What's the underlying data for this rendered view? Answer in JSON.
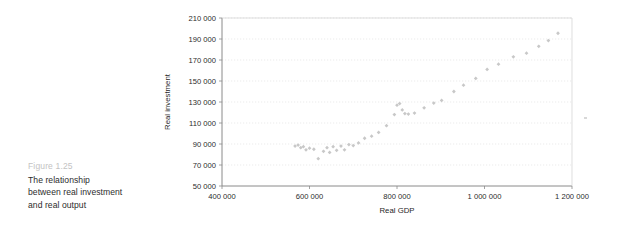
{
  "caption": {
    "figure_number": "Figure 1.25",
    "line1": "The relationship",
    "line2": "between real investment",
    "line3": "and real output"
  },
  "colors": {
    "marker": "#c8c8c8",
    "gridline": "#e2e2e2",
    "axis": "#8a8a8a",
    "figure_number": "#c3c3c3",
    "caption_text": "#2c2c2c",
    "background": "#ffffff"
  },
  "chart_data": {
    "type": "scatter",
    "title": "",
    "xlabel": "Real GDP",
    "ylabel": "Real investment",
    "xlim": [
      400000,
      1200000
    ],
    "ylim": [
      50000,
      210000
    ],
    "xticks": [
      400000,
      600000,
      800000,
      1000000,
      1200000
    ],
    "yticks": [
      50000,
      70000,
      90000,
      110000,
      130000,
      150000,
      170000,
      190000,
      210000
    ],
    "xtick_labels": [
      "400 000",
      "600 000",
      "800 000",
      "1 000 000",
      "1 200 000"
    ],
    "ytick_labels": [
      "50 000",
      "70 000",
      "90 000",
      "110 000",
      "130 000",
      "150 000",
      "170 000",
      "190 000",
      "210 000"
    ],
    "grid": "horizontal-dotted",
    "legend": "none",
    "marker_shape": "diamond",
    "points": [
      {
        "x": 567000,
        "y": 88000
      },
      {
        "x": 574000,
        "y": 89000
      },
      {
        "x": 580000,
        "y": 86500
      },
      {
        "x": 586000,
        "y": 87500
      },
      {
        "x": 592000,
        "y": 84500
      },
      {
        "x": 600000,
        "y": 86000
      },
      {
        "x": 610000,
        "y": 85000
      },
      {
        "x": 620000,
        "y": 76000
      },
      {
        "x": 632000,
        "y": 83000
      },
      {
        "x": 640000,
        "y": 86500
      },
      {
        "x": 646000,
        "y": 82000
      },
      {
        "x": 654000,
        "y": 87500
      },
      {
        "x": 662000,
        "y": 84000
      },
      {
        "x": 672000,
        "y": 88000
      },
      {
        "x": 680000,
        "y": 84500
      },
      {
        "x": 690000,
        "y": 89500
      },
      {
        "x": 700000,
        "y": 88500
      },
      {
        "x": 712000,
        "y": 91000
      },
      {
        "x": 726000,
        "y": 95500
      },
      {
        "x": 742000,
        "y": 97500
      },
      {
        "x": 758000,
        "y": 101000
      },
      {
        "x": 776000,
        "y": 107500
      },
      {
        "x": 794000,
        "y": 118000
      },
      {
        "x": 800000,
        "y": 127000
      },
      {
        "x": 806000,
        "y": 128500
      },
      {
        "x": 812000,
        "y": 122500
      },
      {
        "x": 818000,
        "y": 119000
      },
      {
        "x": 826000,
        "y": 118500
      },
      {
        "x": 840000,
        "y": 119500
      },
      {
        "x": 862000,
        "y": 124500
      },
      {
        "x": 884000,
        "y": 129000
      },
      {
        "x": 902000,
        "y": 131500
      },
      {
        "x": 930000,
        "y": 140000
      },
      {
        "x": 952000,
        "y": 146000
      },
      {
        "x": 980000,
        "y": 152500
      },
      {
        "x": 1006000,
        "y": 161000
      },
      {
        "x": 1032000,
        "y": 166000
      },
      {
        "x": 1066000,
        "y": 173000
      },
      {
        "x": 1096000,
        "y": 176500
      },
      {
        "x": 1124000,
        "y": 183000
      },
      {
        "x": 1146000,
        "y": 188500
      },
      {
        "x": 1168000,
        "y": 195500
      }
    ]
  }
}
